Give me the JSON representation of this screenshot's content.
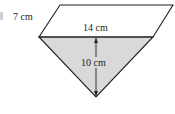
{
  "diagram": {
    "labels": {
      "slant_side": "7 cm",
      "base": "14 cm",
      "height": "10 cm"
    },
    "colors": {
      "stroke": "#231f20",
      "triangle_fill": "#d9d9d9",
      "background": "#ffffff",
      "left_mark": "#cfcfcf"
    },
    "shapes": [
      {
        "name": "parallelogram",
        "filled": false
      },
      {
        "name": "triangle",
        "filled": true
      }
    ]
  }
}
